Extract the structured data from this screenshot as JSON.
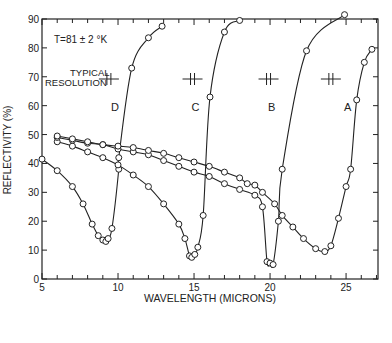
{
  "chart_data": {
    "type": "line",
    "title": "",
    "annotation_temperature": "T=81 ± 2 °K",
    "annotation_resolution": [
      "TYPICAL",
      "RESOLUTION"
    ],
    "xlabel": "WAVELENGTH (MICRONS)",
    "ylabel": "REFLECTIVITY (%)",
    "xlim": [
      5,
      27.1
    ],
    "ylim": [
      0,
      90
    ],
    "xticks_major": [
      5,
      10,
      15,
      20,
      25
    ],
    "yticks_major": [
      0,
      10,
      20,
      30,
      40,
      50,
      60,
      70,
      80,
      90
    ],
    "grid": false,
    "legend": "none (curves labeled inline)",
    "series": [
      {
        "name": "D",
        "label_pos": [
          9.8,
          58
        ],
        "x": [
          5,
          6,
          7,
          7.7,
          8.3,
          8.7,
          9.0,
          9.2,
          9.35,
          9.6,
          10.05,
          10.05,
          10.9,
          12,
          12.9
        ],
        "y": [
          41.5,
          37.5,
          32,
          26,
          19,
          15,
          13.5,
          13,
          14,
          17.5,
          38,
          42,
          73,
          83.5,
          87.5
        ]
      },
      {
        "name": "C",
        "label_pos": [
          15.1,
          58
        ],
        "x": [
          6,
          7,
          8,
          9,
          10,
          11,
          12,
          13,
          14,
          14.4,
          14.7,
          14.85,
          15.05,
          15.25,
          15.6,
          16.05,
          17,
          18
        ],
        "y": [
          47.5,
          46,
          44,
          42,
          39.5,
          36,
          32,
          26,
          19,
          14,
          8,
          7.5,
          8.5,
          11,
          22,
          63,
          85.5,
          89.5
        ]
      },
      {
        "name": "B",
        "label_pos": [
          20.1,
          58
        ],
        "x": [
          6,
          7,
          8,
          9,
          10,
          11,
          12,
          13,
          14,
          15,
          16,
          17,
          18,
          19,
          19.5,
          19.8,
          20,
          20.2,
          20.55,
          20.8,
          22.4,
          24.9
        ],
        "y": [
          49,
          48,
          47,
          46.5,
          45,
          44,
          43,
          41,
          39,
          37,
          35.5,
          33,
          31,
          29,
          25,
          6,
          5.5,
          5,
          20,
          38,
          79,
          91.5
        ]
      },
      {
        "name": "A",
        "label_pos": [
          25.1,
          58
        ],
        "x": [
          6,
          7,
          8,
          9,
          10,
          11,
          12,
          13,
          14,
          15,
          16,
          17,
          18,
          18.5,
          19,
          19.5,
          20.3,
          20.8,
          21.5,
          22.2,
          23,
          23.6,
          24,
          24.5,
          25,
          25.3,
          25.7,
          26.2,
          26.7
        ],
        "y": [
          49.5,
          48.5,
          47.5,
          46.5,
          46,
          45.5,
          44.5,
          43.5,
          42,
          40.5,
          39,
          37,
          35,
          33,
          32.5,
          30,
          26,
          22,
          18,
          14,
          10.5,
          9.5,
          11.5,
          21,
          32,
          38,
          62,
          75,
          79.5
        ]
      }
    ],
    "resolution_markers_x": [
      9.4,
      14.9,
      19.9,
      24.0
    ]
  }
}
